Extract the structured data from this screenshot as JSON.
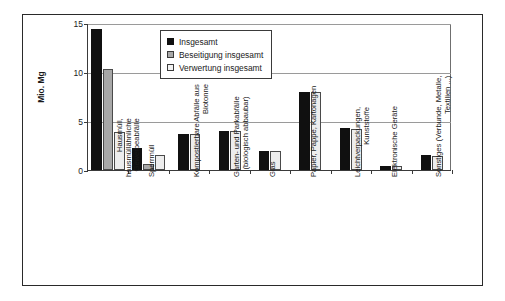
{
  "chart_data": {
    "type": "bar",
    "title": "",
    "xlabel": "",
    "ylabel": "Mio. Mg",
    "ylim": [
      0,
      15
    ],
    "yticks": [
      0,
      5,
      10,
      15
    ],
    "grid": true,
    "legend_position": "top-center",
    "categories": [
      "Hausmüll, hausmüllähnliche Gewerbeabfälle",
      "Sperrmüll",
      "Kompostierbare Abfälle aus Biotonne",
      "Garten- und Parkabfälle (biologisch abbaubar)",
      "Glas",
      "Papier, Pappe, Kartonagen",
      "Leichtverpackungen, Kunststoffe",
      "Elektronische Geräte",
      "Sonstiges (Verbunde, Metalle, Textilien ...)"
    ],
    "category_lines": [
      [
        "Hausmüll,",
        "hausmüllähnliche",
        "Gewerbeabfälle"
      ],
      [
        "Sperrmüll"
      ],
      [
        "Kompostierbare Abfälle aus",
        "Biotonne"
      ],
      [
        "Garten- und Parkabfälle",
        "(biologisch abbaubar)"
      ],
      [
        "Glas"
      ],
      [
        "Papier, Pappe, Kartonagen"
      ],
      [
        "Leichtverpackungen,",
        "Kunststoffe"
      ],
      [
        "Elektronische Geräte"
      ],
      [
        "Sonstiges (Verbunde, Metalle,",
        "Textilien ...)"
      ]
    ],
    "series": [
      {
        "name": "Insgesamt",
        "color": "#101010",
        "values": [
          14.4,
          2.2,
          3.7,
          4.0,
          1.9,
          8.0,
          4.3,
          0.4,
          1.5
        ]
      },
      {
        "name": "Beseitigung insgesamt",
        "color": "#a8a8a8",
        "values": [
          10.3,
          0.6,
          null,
          null,
          null,
          null,
          null,
          null,
          null
        ]
      },
      {
        "name": "Verwertung insgesamt",
        "color": "#ededed",
        "values": [
          3.9,
          1.5,
          3.7,
          4.0,
          1.9,
          8.0,
          4.2,
          0.4,
          1.4
        ]
      }
    ]
  },
  "legend": {
    "items": [
      {
        "label": "Insgesamt"
      },
      {
        "label": "Beseitigung insgesamt"
      },
      {
        "label": "Verwertung insgesamt"
      }
    ]
  },
  "axis": {
    "y_label": "Mio. Mg",
    "y_ticks": [
      "15",
      "10",
      "5",
      "0"
    ]
  }
}
